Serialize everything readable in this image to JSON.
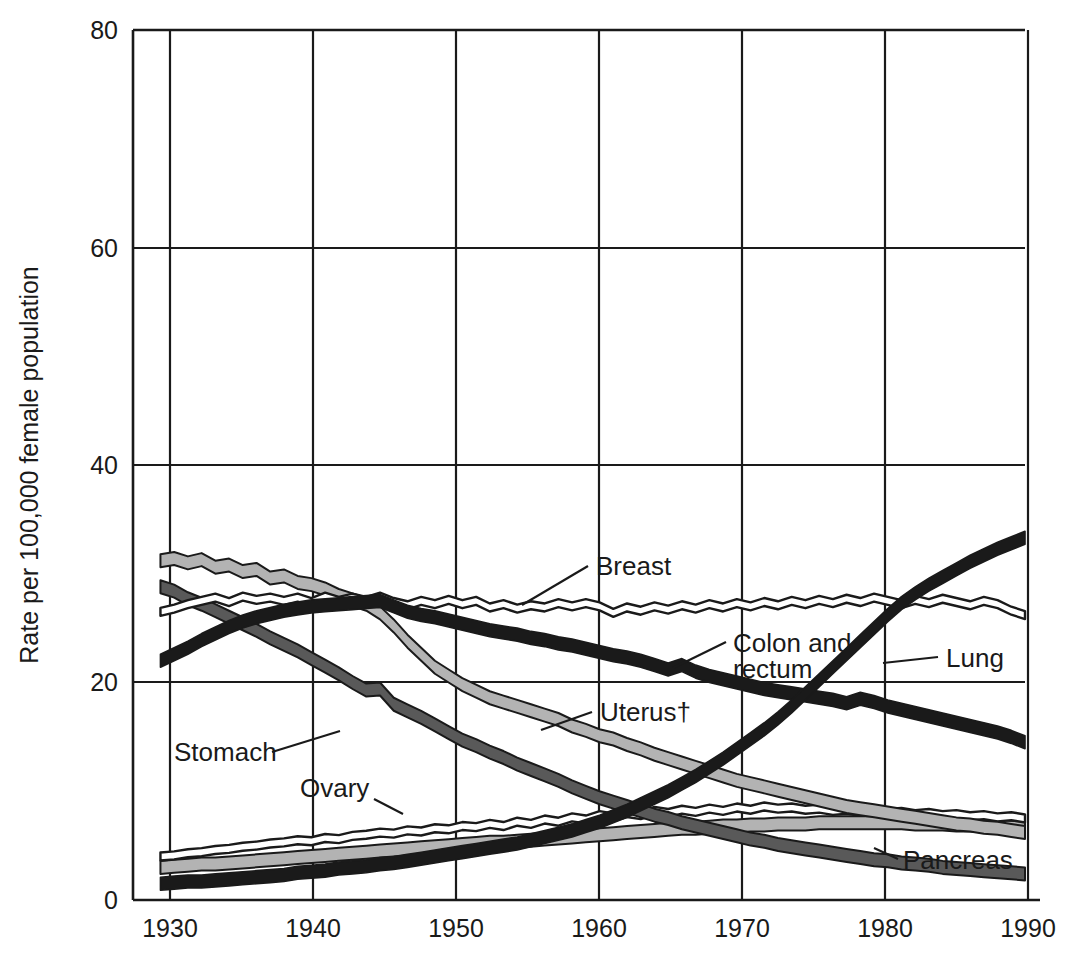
{
  "chart_data": {
    "type": "line",
    "title": "",
    "xlabel": "",
    "ylabel": "Rate per 100,000 female population",
    "xlim": [
      1928,
      1993
    ],
    "ylim": [
      0,
      80
    ],
    "xticks": [
      "1930",
      "1940",
      "1950",
      "1960",
      "1970",
      "1980",
      "1990"
    ],
    "xtick_values": [
      1930,
      1940,
      1950,
      1960,
      1970,
      1980,
      1990
    ],
    "yticks": [
      "0",
      "20",
      "40",
      "60",
      "80"
    ],
    "ytick_values": [
      0,
      20,
      40,
      60,
      80
    ],
    "grid": true,
    "legend_position": "inline-annotations",
    "footnote_marker": "†",
    "x": [
      1930,
      1931,
      1932,
      1933,
      1934,
      1935,
      1936,
      1937,
      1938,
      1939,
      1940,
      1941,
      1942,
      1943,
      1944,
      1945,
      1946,
      1947,
      1948,
      1949,
      1950,
      1951,
      1952,
      1953,
      1954,
      1955,
      1956,
      1957,
      1958,
      1959,
      1960,
      1961,
      1962,
      1963,
      1964,
      1965,
      1966,
      1967,
      1968,
      1969,
      1970,
      1971,
      1972,
      1973,
      1974,
      1975,
      1976,
      1977,
      1978,
      1979,
      1980,
      1981,
      1982,
      1983,
      1984,
      1985,
      1986,
      1987,
      1988,
      1989,
      1990,
      1991,
      1992,
      1993
    ],
    "series": [
      {
        "name": "Lung",
        "style": "thick-black",
        "color": "#1a1a1a",
        "values": [
          1.5,
          1.6,
          1.7,
          1.7,
          1.8,
          1.9,
          2.0,
          2.1,
          2.2,
          2.3,
          2.5,
          2.6,
          2.7,
          2.9,
          3.0,
          3.1,
          3.3,
          3.4,
          3.6,
          3.8,
          4.0,
          4.2,
          4.4,
          4.6,
          4.8,
          5.0,
          5.2,
          5.5,
          5.8,
          6.1,
          6.4,
          6.8,
          7.2,
          7.7,
          8.2,
          8.8,
          9.4,
          10.0,
          10.7,
          11.4,
          12.2,
          13.0,
          13.9,
          14.8,
          15.7,
          16.7,
          17.8,
          19.0,
          20.2,
          21.4,
          22.6,
          23.8,
          25.0,
          26.2,
          27.3,
          28.2,
          29.0,
          29.7,
          30.4,
          31.1,
          31.7,
          32.3,
          32.8,
          33.3
        ]
      },
      {
        "name": "Breast",
        "style": "thin-outline",
        "color": "#1a1a1a",
        "values": [
          26.5,
          26.8,
          27.2,
          27.5,
          27.8,
          27.4,
          27.9,
          27.6,
          27.8,
          27.5,
          27.8,
          27.4,
          27.9,
          27.5,
          27.8,
          27.5,
          27.9,
          27.4,
          27.1,
          27.5,
          27.2,
          27.6,
          27.2,
          27.5,
          26.9,
          27.2,
          26.8,
          27.1,
          26.9,
          27.3,
          27.0,
          27.3,
          27.0,
          26.4,
          26.9,
          26.6,
          27.0,
          26.7,
          27.1,
          26.8,
          27.2,
          26.9,
          27.3,
          27.0,
          27.4,
          27.1,
          27.5,
          27.2,
          27.6,
          27.3,
          27.7,
          27.4,
          27.8,
          27.5,
          27.2,
          27.6,
          27.3,
          27.7,
          27.4,
          27.1,
          27.5,
          27.2,
          26.6,
          26.2
        ]
      },
      {
        "name": "Colon and rectum",
        "style": "thick-black",
        "color": "#1a1a1a",
        "values": [
          22.0,
          22.6,
          23.2,
          23.9,
          24.5,
          25.1,
          25.6,
          26.0,
          26.3,
          26.6,
          26.8,
          27.0,
          27.1,
          27.2,
          27.3,
          27.4,
          27.5,
          27.0,
          26.5,
          26.2,
          26.0,
          25.7,
          25.4,
          25.1,
          24.8,
          24.6,
          24.4,
          24.1,
          23.9,
          23.6,
          23.4,
          23.1,
          22.8,
          22.5,
          22.3,
          22.0,
          21.6,
          21.2,
          21.6,
          21.0,
          20.6,
          20.3,
          20.0,
          19.7,
          19.4,
          19.2,
          19.0,
          18.8,
          18.6,
          18.4,
          18.1,
          18.5,
          18.2,
          17.8,
          17.5,
          17.2,
          16.9,
          16.6,
          16.3,
          16.0,
          15.7,
          15.4,
          15.0,
          14.5
        ]
      },
      {
        "name": "Uterus",
        "style": "thick-lightgray",
        "color": "#b3b3b3",
        "values": [
          31.2,
          31.4,
          31.0,
          31.3,
          30.6,
          30.8,
          30.2,
          30.4,
          29.6,
          29.8,
          29.2,
          29.0,
          28.6,
          28.0,
          27.6,
          27.2,
          26.4,
          25.2,
          23.8,
          22.6,
          21.4,
          20.6,
          19.8,
          19.2,
          18.6,
          18.2,
          17.8,
          17.4,
          17.0,
          16.6,
          16.0,
          15.6,
          15.1,
          14.8,
          14.3,
          13.9,
          13.4,
          13.0,
          12.6,
          12.2,
          11.8,
          11.4,
          11.0,
          10.7,
          10.4,
          10.1,
          9.8,
          9.5,
          9.2,
          8.9,
          8.6,
          8.4,
          8.2,
          8.0,
          7.8,
          7.6,
          7.4,
          7.2,
          7.0,
          6.9,
          6.7,
          6.6,
          6.4,
          6.2
        ]
      },
      {
        "name": "Stomach",
        "style": "thick-darkgray",
        "color": "#595959",
        "values": [
          28.8,
          28.4,
          27.7,
          27.2,
          26.6,
          26.0,
          25.4,
          24.8,
          24.1,
          23.5,
          22.9,
          22.2,
          21.5,
          20.8,
          20.0,
          19.3,
          19.4,
          18.0,
          17.4,
          16.8,
          16.1,
          15.4,
          14.7,
          14.2,
          13.6,
          13.1,
          12.5,
          12.0,
          11.5,
          11.0,
          10.4,
          9.9,
          9.4,
          9.0,
          8.6,
          8.2,
          7.8,
          7.5,
          7.1,
          6.8,
          6.5,
          6.2,
          5.9,
          5.6,
          5.4,
          5.1,
          4.9,
          4.7,
          4.5,
          4.3,
          4.1,
          3.9,
          3.7,
          3.6,
          3.4,
          3.3,
          3.2,
          3.0,
          2.9,
          2.8,
          2.7,
          2.6,
          2.5,
          2.4
        ]
      },
      {
        "name": "Ovary",
        "style": "thin-outline",
        "color": "#1a1a1a",
        "values": [
          4.0,
          4.1,
          4.3,
          4.4,
          4.6,
          4.7,
          4.9,
          5.0,
          5.2,
          5.3,
          5.5,
          5.4,
          5.7,
          5.6,
          5.9,
          6.0,
          6.2,
          6.1,
          6.4,
          6.3,
          6.6,
          6.5,
          6.8,
          6.7,
          7.0,
          6.8,
          7.2,
          7.0,
          7.4,
          7.2,
          7.6,
          7.4,
          7.8,
          7.6,
          8.0,
          7.8,
          8.2,
          8.0,
          8.3,
          8.1,
          8.4,
          8.2,
          8.5,
          8.3,
          8.6,
          8.4,
          8.5,
          8.3,
          8.4,
          8.2,
          8.3,
          8.1,
          8.2,
          8.0,
          8.1,
          7.9,
          8.0,
          7.8,
          7.9,
          7.7,
          7.8,
          7.6,
          7.7,
          7.5
        ]
      },
      {
        "name": "Pancreas",
        "style": "thick-lightgray",
        "color": "#b3b3b3",
        "values": [
          3.0,
          3.1,
          3.2,
          3.3,
          3.3,
          3.4,
          3.5,
          3.6,
          3.7,
          3.8,
          3.9,
          4.0,
          4.1,
          4.2,
          4.3,
          4.4,
          4.5,
          4.6,
          4.7,
          4.8,
          4.9,
          5.0,
          5.1,
          5.2,
          5.3,
          5.3,
          5.4,
          5.5,
          5.6,
          5.7,
          5.8,
          5.9,
          6.0,
          6.1,
          6.2,
          6.3,
          6.4,
          6.5,
          6.6,
          6.6,
          6.7,
          6.8,
          6.8,
          6.9,
          6.9,
          7.0,
          7.0,
          7.0,
          7.1,
          7.1,
          7.1,
          7.1,
          7.1,
          7.1,
          7.1,
          7.0,
          7.0,
          7.0,
          6.9,
          6.9,
          6.8,
          6.8,
          6.7,
          6.6
        ]
      }
    ],
    "annotations": [
      {
        "label": "Breast",
        "id": "breast"
      },
      {
        "label": "Colon and",
        "id": "colon-line1"
      },
      {
        "label": "rectum",
        "id": "colon-line2"
      },
      {
        "label": "Lung",
        "id": "lung"
      },
      {
        "label": "Uterus†",
        "id": "uterus"
      },
      {
        "label": "Stomach",
        "id": "stomach"
      },
      {
        "label": "Ovary",
        "id": "ovary"
      },
      {
        "label": "Pancreas",
        "id": "pancreas"
      }
    ]
  },
  "axis": {
    "ylabel": "Rate per 100,000 female population",
    "yticks": [
      "80",
      "60",
      "40",
      "20",
      "0"
    ],
    "xticks": [
      "1930",
      "1940",
      "1950",
      "1960",
      "1970",
      "1980",
      "1990"
    ]
  },
  "labels": {
    "breast": "Breast",
    "colon_l1": "Colon and",
    "colon_l2": "rectum",
    "lung": "Lung",
    "uterus": "Uterus†",
    "stomach": "Stomach",
    "ovary": "Ovary",
    "pancreas": "Pancreas"
  },
  "colors": {
    "ink": "#1a1a1a",
    "light_gray": "#b3b3b3",
    "dark_gray": "#595959",
    "background": "#ffffff"
  }
}
